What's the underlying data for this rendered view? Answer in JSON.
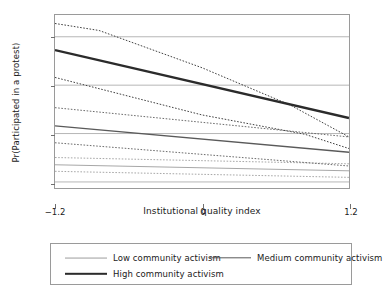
{
  "chart_data": {
    "type": "line",
    "title": "",
    "xlabel": "Institutional quality index",
    "ylabel": "Pr(Participated in a protest)",
    "xlim": [
      -1.2,
      1.2
    ],
    "ylim": [
      -0.025,
      0.69
    ],
    "xticks": [
      -1.2,
      0,
      1.2
    ],
    "xtick_labels": [
      "−1.2",
      "0",
      "1.2"
    ],
    "yticks": [
      0,
      0.2,
      0.4,
      0.6
    ],
    "ytick_labels": [
      "0",
      ".2",
      ".4",
      ".6"
    ],
    "grid": "horizontal",
    "legend_position": "below-plot",
    "series": [
      {
        "name": "Low community activism",
        "style": "solid",
        "linewidth": 0.9,
        "color": "#9c9c9c",
        "x": [
          -1.2,
          1.2
        ],
        "values": [
          0.071,
          0.046
        ],
        "ci_upper": {
          "style": "dotted",
          "x": [
            -1.2,
            1.2
          ],
          "values": [
            0.101,
            0.075
          ]
        },
        "ci_lower": {
          "style": "dotted",
          "x": [
            -1.2,
            1.2
          ],
          "values": [
            0.044,
            0.019
          ]
        }
      },
      {
        "name": "Medium community activism",
        "style": "solid",
        "linewidth": 1.4,
        "color": "#5a5a5a",
        "x": [
          -1.2,
          1.2
        ],
        "values": [
          0.232,
          0.123
        ],
        "ci_upper": {
          "style": "dotted",
          "x": [
            -1.2,
            1.2
          ],
          "values": [
            0.307,
            0.186
          ]
        },
        "ci_lower": {
          "style": "dotted",
          "x": [
            -1.2,
            1.2
          ],
          "values": [
            0.162,
            0.066
          ]
        }
      },
      {
        "name": "High community activism",
        "style": "solid",
        "linewidth": 2.4,
        "color": "#2b2b2b",
        "x": [
          -1.2,
          1.2
        ],
        "values": [
          0.545,
          0.264
        ],
        "ci_upper": {
          "style": "dotted",
          "x": [
            -1.2,
            -0.84,
            -0.72,
            0.0,
            0.72,
            1.2
          ],
          "values": [
            0.655,
            0.626,
            0.604,
            0.472,
            0.318,
            0.186
          ]
        },
        "ci_lower": {
          "style": "dotted",
          "x": [
            -1.2,
            0.0,
            0.84,
            1.2
          ],
          "values": [
            0.432,
            0.277,
            0.197,
            0.138
          ]
        }
      }
    ],
    "legend": [
      "Low community activism",
      "Medium community activism",
      "High community activism"
    ],
    "colors": {
      "grid": "#b5b5b5",
      "frame": "#9a9a9a",
      "axis": "#6f6f6f",
      "low": "#9c9c9c",
      "medium": "#5a5a5a",
      "high": "#2b2b2b",
      "background": "#ffffff"
    }
  }
}
